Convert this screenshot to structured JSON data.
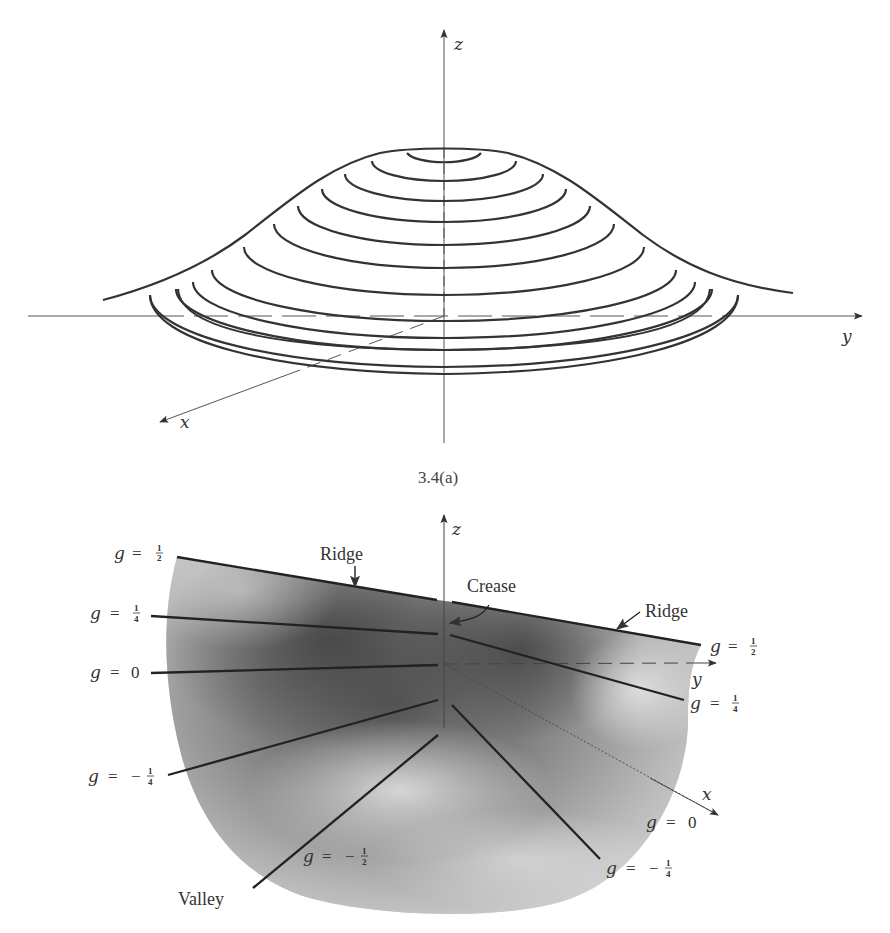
{
  "figure_top": {
    "caption": "3.4(a)",
    "axis_labels": {
      "z": "z",
      "y": "y",
      "x": "x"
    },
    "contour_count": 12
  },
  "figure_bottom": {
    "axis_labels": {
      "z": "z",
      "y": "y",
      "x": "x"
    },
    "annotations": {
      "ridge_left": "Ridge",
      "ridge_right": "Ridge",
      "crease": "Crease",
      "valley": "Valley"
    },
    "level_labels": {
      "left_half": {
        "g": "g",
        "eq": "=",
        "num": "1",
        "den": "2"
      },
      "left_quarter": {
        "g": "g",
        "eq": "=",
        "num": "1",
        "den": "4"
      },
      "left_zero": {
        "g": "g",
        "eq": "=",
        "val": "0"
      },
      "left_neg_quarter": {
        "g": "g",
        "eq": "=",
        "sign": "−",
        "num": "1",
        "den": "4"
      },
      "bottom_neg_half": {
        "g": "g",
        "eq": "=",
        "sign": "−",
        "num": "1",
        "den": "2"
      },
      "right_half": {
        "g": "g",
        "eq": "=",
        "num": "1",
        "den": "2"
      },
      "right_quarter": {
        "g": "g",
        "eq": "=",
        "num": "1",
        "den": "4"
      },
      "right_zero": {
        "g": "g",
        "eq": "=",
        "val": "0"
      },
      "right_neg_quarter": {
        "g": "g",
        "eq": "=",
        "sign": "−",
        "num": "1",
        "den": "4"
      }
    }
  }
}
